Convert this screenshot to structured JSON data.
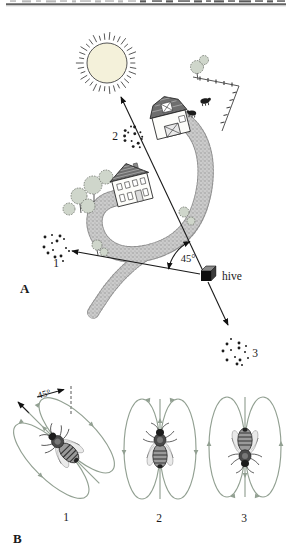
{
  "panel_a": {
    "label": "A",
    "angle_label": "45°",
    "hive_label": "hive",
    "food_sources": [
      {
        "label": "1"
      },
      {
        "label": "2"
      },
      {
        "label": "3"
      }
    ]
  },
  "panel_b": {
    "label": "B",
    "angle_label": "45°",
    "dances": [
      {
        "label": "1",
        "axis_from_vertical_deg": 45
      },
      {
        "label": "2",
        "axis_from_vertical_deg": 0
      },
      {
        "label": "3",
        "axis_from_vertical_deg": 180
      }
    ]
  },
  "colors": {
    "ink": "#1a1a1a",
    "dance_loop": "#92a092",
    "road": "#cccccc",
    "sun_fill": "#f4f1da"
  }
}
